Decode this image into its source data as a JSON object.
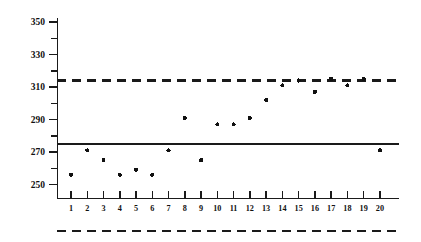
{
  "chart_data": {
    "type": "scatter",
    "title": "",
    "subtitle": "",
    "xlabel": "",
    "ylabel": "",
    "x": [
      1,
      2,
      3,
      4,
      5,
      6,
      7,
      8,
      9,
      10,
      11,
      12,
      13,
      14,
      15,
      16,
      17,
      18,
      19,
      20
    ],
    "values": [
      256,
      271,
      265,
      256,
      259,
      256,
      271,
      291,
      265,
      287,
      287,
      291,
      302,
      311,
      314,
      307,
      315,
      311,
      315,
      271
    ],
    "series": [
      {
        "name": "observation",
        "marker": "filled-circle",
        "values": [
          256,
          271,
          265,
          256,
          259,
          256,
          271,
          291,
          265,
          287,
          287,
          291,
          302,
          311,
          314,
          307,
          315,
          311,
          315,
          271
        ]
      }
    ],
    "xlim": [
      0.35,
      20.65
    ],
    "ylim": [
      243,
      354
    ],
    "grid": false,
    "legend": false,
    "legend_position": "none",
    "y_major_ticks": [
      250,
      270,
      290,
      310,
      330,
      350
    ],
    "y_major_tick_labels": [
      "250",
      "270",
      "290",
      "310",
      "330",
      "350"
    ],
    "y_minor_ticks": [
      260,
      280,
      300,
      320,
      340
    ],
    "x_ticks": [
      1,
      2,
      3,
      4,
      5,
      6,
      7,
      8,
      9,
      10,
      11,
      12,
      13,
      14,
      15,
      16,
      17,
      18,
      19,
      20
    ],
    "x_tick_labels": [
      "1",
      "2",
      "3",
      "4",
      "5",
      "6",
      "7",
      "8",
      "9",
      "10",
      "11",
      "12",
      "13",
      "14",
      "15",
      "16",
      "17",
      "18",
      "19",
      "20"
    ],
    "reference_lines": [
      {
        "name": "center-line",
        "style": "solid",
        "value": 275,
        "label": ""
      },
      {
        "name": "upper-limit-line",
        "style": "dashed",
        "value": 314,
        "label": ""
      }
    ],
    "bottom_rule": {
      "name": "bottom-dashed-rule",
      "style": "dashed"
    },
    "colors": {
      "ink": "#111111",
      "background": "#ffffff",
      "marker": "#111111"
    }
  }
}
